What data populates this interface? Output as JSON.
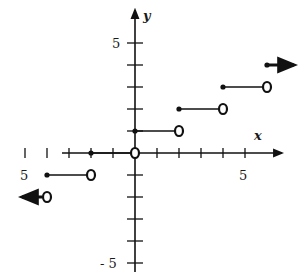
{
  "chart_data": {
    "type": "line",
    "title": "",
    "xlabel": "x",
    "ylabel": "y",
    "xlim": [
      -5,
      6
    ],
    "ylim": [
      -5,
      5
    ],
    "x_tick_labels": [
      "5",
      "5"
    ],
    "y_tick_labels": [
      "5",
      "- 5"
    ],
    "x_tick_values": [
      -5,
      -4,
      -3,
      -2,
      -1,
      1,
      2,
      3,
      4,
      5
    ],
    "y_tick_values": [
      -5,
      -4,
      -3,
      -2,
      -1,
      1,
      2,
      3,
      4,
      5
    ],
    "grid": false,
    "function": "step",
    "segments": [
      {
        "x_start": null,
        "x_end": -4,
        "y": -2,
        "start_closed": false,
        "end_closed": false,
        "arrow_left": true
      },
      {
        "x_start": -4,
        "x_end": -2,
        "y": -1,
        "start_closed": true,
        "end_closed": false
      },
      {
        "x_start": -2,
        "x_end": 0,
        "y": 0,
        "start_closed": true,
        "end_closed": false
      },
      {
        "x_start": 0,
        "x_end": 2,
        "y": 1,
        "start_closed": true,
        "end_closed": false
      },
      {
        "x_start": 2,
        "x_end": 4,
        "y": 2,
        "start_closed": true,
        "end_closed": false
      },
      {
        "x_start": 4,
        "x_end": 6,
        "y": 3,
        "start_closed": true,
        "end_closed": false
      },
      {
        "x_start": 6,
        "x_end": null,
        "y": 4,
        "start_closed": true,
        "end_closed": false,
        "arrow_right": true
      }
    ]
  }
}
